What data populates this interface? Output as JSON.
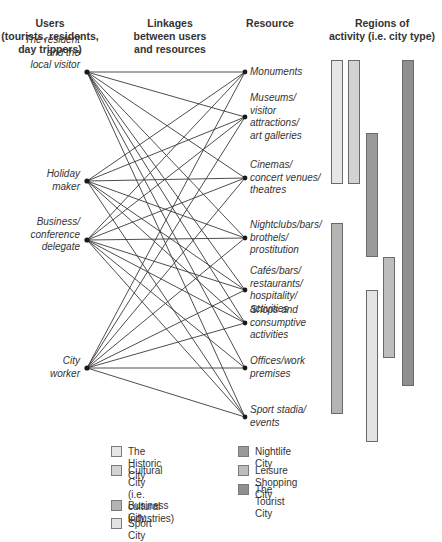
{
  "headers": {
    "users": "Users\n(tourists, residents,\nday trippers)",
    "linkages": "Linkages\nbetween users\nand resources",
    "resource": "Resource",
    "regions": "Regions of\nactivity (i.e. city type)"
  },
  "users": [
    {
      "label": "The resident\nand the\nlocal visitor",
      "y": 72
    },
    {
      "label": "Holiday\nmaker",
      "y": 181
    },
    {
      "label": "Business/\nconference\ndelegate",
      "y": 240
    },
    {
      "label": "City\nworker",
      "y": 368
    }
  ],
  "resources": [
    {
      "label": "Monuments",
      "y": 72
    },
    {
      "label": "Museums/\nvisitor\nattractions/\nart galleries",
      "y": 117
    },
    {
      "label": "Cinemas/\nconcert venues/\ntheatres",
      "y": 178
    },
    {
      "label": "Nightclubs/bars/\nbrothels/\nprostitution",
      "y": 238
    },
    {
      "label": "Cafés/bars/\nrestaurants/\nhospitality/\nactivities",
      "y": 290
    },
    {
      "label": "Shops and\nconsumptive\nactivities",
      "y": 323
    },
    {
      "label": "Offices/work\npremises",
      "y": 368
    },
    {
      "label": "Sport stadia/\nevents",
      "y": 417
    }
  ],
  "links": [
    [
      0,
      0
    ],
    [
      0,
      1
    ],
    [
      0,
      2
    ],
    [
      0,
      3
    ],
    [
      0,
      4
    ],
    [
      0,
      5
    ],
    [
      0,
      6
    ],
    [
      0,
      7
    ],
    [
      1,
      0
    ],
    [
      1,
      1
    ],
    [
      1,
      2
    ],
    [
      1,
      3
    ],
    [
      1,
      4
    ],
    [
      1,
      5
    ],
    [
      1,
      7
    ],
    [
      2,
      0
    ],
    [
      2,
      1
    ],
    [
      2,
      2
    ],
    [
      2,
      3
    ],
    [
      2,
      4
    ],
    [
      2,
      5
    ],
    [
      2,
      6
    ],
    [
      2,
      7
    ],
    [
      3,
      0
    ],
    [
      3,
      1
    ],
    [
      3,
      2
    ],
    [
      3,
      3
    ],
    [
      3,
      4
    ],
    [
      3,
      5
    ],
    [
      3,
      6
    ],
    [
      3,
      7
    ]
  ],
  "city_types": [
    {
      "name": "The Historic City",
      "color": "#e6e6e6",
      "bar": {
        "x": 331,
        "top": 60,
        "bottom": 184
      }
    },
    {
      "name": "Cultural City\n(i.e. cultural industries)",
      "color": "#d2d2d2",
      "bar": {
        "x": 348,
        "top": 60,
        "bottom": 184
      }
    },
    {
      "name": "Business City",
      "color": "#b4b4b4",
      "bar": {
        "x": 331,
        "top": 223,
        "bottom": 414
      }
    },
    {
      "name": "Sport City",
      "color": "#e3e3e3",
      "bar": {
        "x": 366,
        "top": 290,
        "bottom": 442
      }
    },
    {
      "name": "Nightlife City",
      "color": "#9a9a9a",
      "bar": {
        "x": 366,
        "top": 133,
        "bottom": 257
      }
    },
    {
      "name": "Leisure Shopping City",
      "color": "#bdbdbd",
      "bar": {
        "x": 383,
        "top": 257,
        "bottom": 358
      }
    },
    {
      "name": "The Tourist City",
      "color": "#8f8f8f",
      "bar": {
        "x": 402,
        "top": 60,
        "bottom": 386
      }
    }
  ],
  "legend": {
    "left": [
      {
        "label": "The Historic City",
        "color": "#e6e6e6"
      },
      {
        "label": "Cultural City\n(i.e. cultural industries)",
        "color": "#d2d2d2"
      },
      {
        "label": "Business City",
        "color": "#b4b4b4"
      },
      {
        "label": "Sport City",
        "color": "#e3e3e3"
      }
    ],
    "right": [
      {
        "label": "Nightlife City",
        "color": "#9a9a9a"
      },
      {
        "label": "Leisure Shopping City",
        "color": "#bdbdbd"
      },
      {
        "label": "The Tourist City",
        "color": "#8f8f8f"
      }
    ]
  },
  "style": {
    "line_color": "#3a3a3a",
    "node_color": "#1a1a1a"
  }
}
